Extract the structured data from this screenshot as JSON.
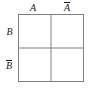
{
  "diagram": {
    "type": "karnaugh-map",
    "title": "",
    "grid": {
      "rows": 2,
      "columns": 2,
      "line_color": "#808080",
      "background_color": "#ffffff"
    },
    "column_labels": [
      {
        "id": "a",
        "text": "A",
        "negated": false
      },
      {
        "id": "a-not",
        "text": "A",
        "negated": true
      }
    ],
    "row_labels": [
      {
        "id": "b",
        "text": "B",
        "negated": false
      },
      {
        "id": "b-not",
        "text": "B",
        "negated": true
      }
    ],
    "cells": [
      {
        "id": "cell-a-b",
        "row": 0,
        "col": 0,
        "text": ""
      },
      {
        "id": "cell-anot-b",
        "row": 0,
        "col": 1,
        "text": ""
      },
      {
        "id": "cell-a-bnot",
        "row": 1,
        "col": 0,
        "text": ""
      },
      {
        "id": "cell-anot-bnot",
        "row": 1,
        "col": 1,
        "text": ""
      }
    ]
  }
}
